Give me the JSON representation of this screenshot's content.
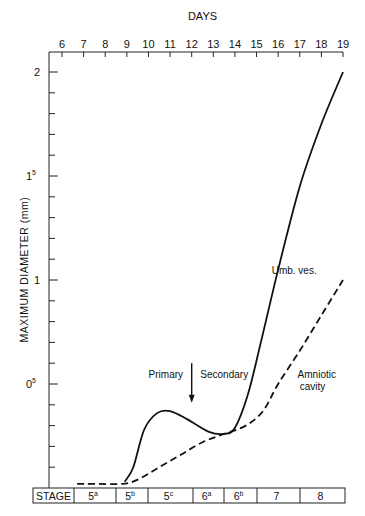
{
  "chart_data": {
    "type": "line",
    "title": "",
    "top_axis_label": "DAYS",
    "x": [
      6,
      7,
      8,
      9,
      10,
      11,
      12,
      13,
      14,
      15,
      16,
      17,
      18,
      19
    ],
    "xlabel": "DAYS",
    "ylabel": "MAXIMUM   DIAMETER   (mm)",
    "ylim": [
      0,
      2.1
    ],
    "ytick_labels": [
      {
        "value": 2,
        "label": "2"
      },
      {
        "value": 1.5,
        "label": "1",
        "sup": "5"
      },
      {
        "value": 1,
        "label": "1"
      },
      {
        "value": 0.5,
        "label": "0",
        "sup": "5"
      }
    ],
    "series": [
      {
        "name": "Umb. ves.",
        "style": "solid",
        "points": [
          [
            8.9,
            0.03
          ],
          [
            9.3,
            0.1
          ],
          [
            9.8,
            0.28
          ],
          [
            10.4,
            0.36
          ],
          [
            11,
            0.37
          ],
          [
            11.8,
            0.33
          ],
          [
            12.8,
            0.27
          ],
          [
            13.5,
            0.26
          ],
          [
            14,
            0.29
          ],
          [
            14.6,
            0.45
          ],
          [
            15.2,
            0.7
          ],
          [
            16,
            1.05
          ],
          [
            17,
            1.45
          ],
          [
            18,
            1.75
          ],
          [
            19,
            2.0
          ]
        ]
      },
      {
        "name": "Amniotic cavity",
        "style": "dashed",
        "points": [
          [
            6.7,
            0.02
          ],
          [
            7.5,
            0.02
          ],
          [
            8.8,
            0.02
          ],
          [
            9.5,
            0.04
          ],
          [
            10.5,
            0.1
          ],
          [
            11.5,
            0.16
          ],
          [
            12.5,
            0.22
          ],
          [
            13.5,
            0.26
          ],
          [
            14.5,
            0.3
          ],
          [
            15.3,
            0.37
          ],
          [
            16,
            0.5
          ],
          [
            17,
            0.66
          ],
          [
            18,
            0.83
          ],
          [
            19,
            1.0
          ]
        ]
      }
    ],
    "annotations": [
      {
        "text": "Primary",
        "day": 11.6,
        "value": 0.53
      },
      {
        "text": "Secondary",
        "day": 12.4,
        "value": 0.53
      },
      {
        "text": "arrow-down",
        "day": 12.0,
        "from": 0.6,
        "to": 0.41
      },
      {
        "text": "Umb. ves.",
        "day": 15.7,
        "value": 1.03
      },
      {
        "text": "Amniotic",
        "day": 16.9,
        "value": 0.53
      },
      {
        "text": "cavity",
        "day": 17.0,
        "value": 0.47
      }
    ],
    "stage_row": {
      "label": "STAGE",
      "stages": [
        {
          "base": "5",
          "sup": "a"
        },
        {
          "base": "5",
          "sup": "b"
        },
        {
          "base": "5",
          "sup": "c"
        },
        {
          "base": "6",
          "sup": "a"
        },
        {
          "base": "6",
          "sup": "b"
        },
        {
          "base": "7",
          "sup": ""
        },
        {
          "base": "8",
          "sup": ""
        }
      ]
    },
    "grid": false,
    "legend": "none (inline labels)"
  }
}
